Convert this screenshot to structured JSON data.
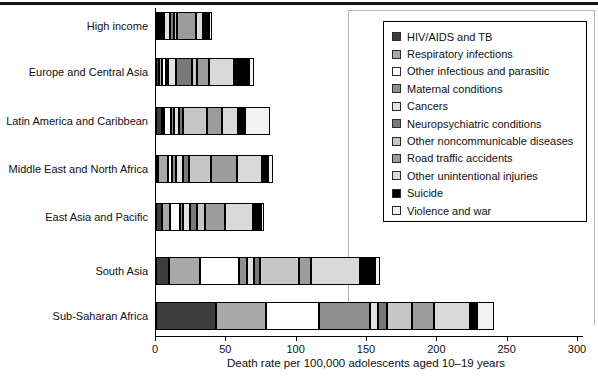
{
  "chart_data": {
    "type": "bar",
    "orientation": "horizontal",
    "stacked": true,
    "title": "",
    "xlabel": "Death rate per 100,000 adolescents aged 10–19 years",
    "ylabel": "",
    "xlim": [
      0,
      300
    ],
    "xticks": [
      0,
      50,
      100,
      150,
      200,
      250,
      300
    ],
    "grid": false,
    "legend_position": "top-right",
    "categories": [
      "High income",
      "Europe and Central Asia",
      "Latin America and Caribbean",
      "Middle East and North Africa",
      "East Asia and Pacific",
      "South Asia",
      "Sub-Saharan Africa"
    ],
    "series": [
      {
        "name": "HIV/AIDS and TB",
        "color": "#3d3d3d",
        "values": [
          0.5,
          2,
          4,
          1,
          4,
          9,
          43
        ]
      },
      {
        "name": "Respiratory infections",
        "color": "#a8a8a8",
        "values": [
          1,
          2.5,
          2,
          7,
          6,
          22,
          35
        ]
      },
      {
        "name": "Other infectious and parasitic",
        "color": "#ffffff",
        "values": [
          1,
          2.5,
          5,
          3,
          7,
          28,
          38
        ]
      },
      {
        "name": "Maternal conditions",
        "color": "#8e8e8e",
        "values": [
          0.5,
          1,
          2,
          3,
          2,
          6,
          36
        ]
      },
      {
        "name": "Cancers",
        "color": "#e2e2e2",
        "values": [
          4,
          6,
          3,
          5,
          5,
          5,
          6
        ]
      },
      {
        "name": "Neuropsychiatric conditions",
        "color": "#787878",
        "values": [
          3,
          11,
          3,
          4,
          5,
          4,
          6
        ]
      },
      {
        "name": "Other noncommunicable diseases",
        "color": "#c6c6c6",
        "values": [
          2,
          4,
          17,
          16,
          6,
          28,
          18
        ]
      },
      {
        "name": "Road traffic accidents",
        "color": "#9c9c9c",
        "values": [
          14,
          8,
          11,
          18,
          14,
          8,
          16
        ]
      },
      {
        "name": "Other unintentional injuries",
        "color": "#d9d9d9",
        "values": [
          5,
          18,
          11,
          18,
          20,
          35,
          25
        ]
      },
      {
        "name": "Suicide",
        "color": "#000000",
        "values": [
          4,
          10.5,
          5,
          4,
          6,
          11,
          5
        ]
      },
      {
        "name": "Violence and war",
        "color": "#f2f2f2",
        "values": [
          2,
          3.5,
          18,
          4,
          2,
          3,
          12
        ]
      }
    ],
    "region_totals": [
      37,
      69.5,
      81,
      83,
      77,
      159,
      240
    ]
  },
  "colors": {
    "axis": "#000000",
    "top_rule": "#151515",
    "frame": "#b4b4b4"
  }
}
